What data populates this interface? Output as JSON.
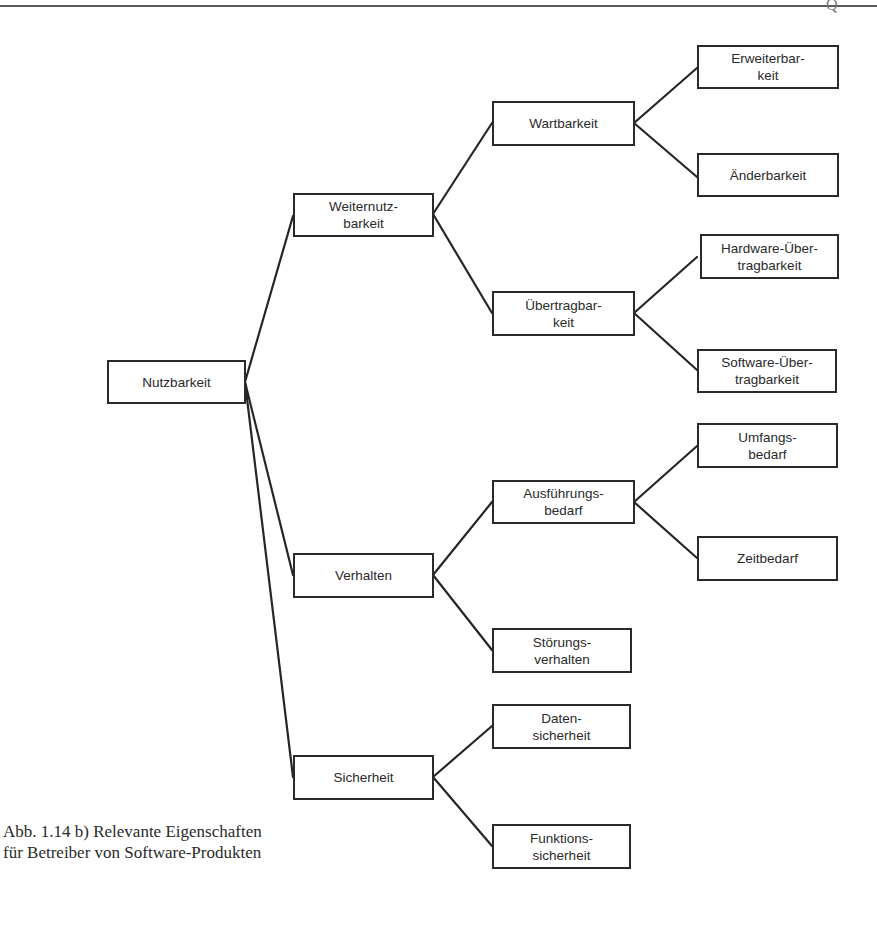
{
  "header": {
    "mark": "Q"
  },
  "diagram": {
    "root": {
      "id": "nutzbarkeit",
      "label": "Nutzbarkeit"
    },
    "nodes": {
      "nutzbarkeit": {
        "label": "Nutzbarkeit"
      },
      "weiternutzbarkeit": {
        "label": "Weiternutz-\nbarkeit"
      },
      "verhalten": {
        "label": "Verhalten"
      },
      "sicherheit": {
        "label": "Sicherheit"
      },
      "wartbarkeit": {
        "label": "Wartbarkeit"
      },
      "uebertragbarkeit": {
        "label": "Übertragbar-\nkeit"
      },
      "ausfuehrungsbedarf": {
        "label": "Ausführungs-\nbedarf"
      },
      "stoerungsverhalten": {
        "label": "Störungs-\nverhalten"
      },
      "erweiterbarkeit": {
        "label": "Erweiterbar-\nkeit"
      },
      "aenderbarkeit": {
        "label": "Änderbarkeit"
      },
      "hardware_uebertragbarkeit": {
        "label": "Hardware-Über-\ntragbarkeit"
      },
      "software_uebertragbarkeit": {
        "label": "Software-Über-\ntragbarkeit"
      },
      "umfangsbedarf": {
        "label": "Umfangs-\nbedarf"
      },
      "zeitbedarf": {
        "label": "Zeitbedarf"
      },
      "datensicherheit": {
        "label": "Daten-\nsicherheit"
      },
      "funktionssicherheit": {
        "label": "Funktions-\nsicherheit"
      }
    },
    "edges": [
      [
        "nutzbarkeit",
        "weiternutzbarkeit"
      ],
      [
        "nutzbarkeit",
        "verhalten"
      ],
      [
        "nutzbarkeit",
        "sicherheit"
      ],
      [
        "weiternutzbarkeit",
        "wartbarkeit"
      ],
      [
        "weiternutzbarkeit",
        "uebertragbarkeit"
      ],
      [
        "wartbarkeit",
        "erweiterbarkeit"
      ],
      [
        "wartbarkeit",
        "aenderbarkeit"
      ],
      [
        "uebertragbarkeit",
        "hardware_uebertragbarkeit"
      ],
      [
        "uebertragbarkeit",
        "software_uebertragbarkeit"
      ],
      [
        "verhalten",
        "ausfuehrungsbedarf"
      ],
      [
        "verhalten",
        "stoerungsverhalten"
      ],
      [
        "ausfuehrungsbedarf",
        "umfangsbedarf"
      ],
      [
        "ausfuehrungsbedarf",
        "zeitbedarf"
      ],
      [
        "sicherheit",
        "datensicherheit"
      ],
      [
        "sicherheit",
        "funktionssicherheit"
      ]
    ]
  },
  "caption": {
    "line1": "Abb. 1.14 b) Relevante Eigenschaften",
    "line2": "für Betreiber von Software-Produkten"
  }
}
